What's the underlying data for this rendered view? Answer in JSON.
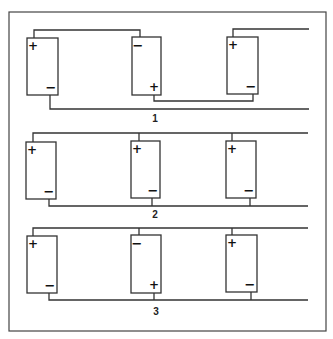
{
  "figure": {
    "colors": {
      "line": "#333333",
      "background": "#ffffff",
      "frame": "#444444"
    },
    "frame": {
      "x": 9,
      "y": 12,
      "w": 317,
      "h": 319
    },
    "diagrams": [
      {
        "label": "1",
        "label_pos": [
          155,
          122
        ],
        "type": "series",
        "batteries": [
          {
            "x": 27,
            "y": 38,
            "w": 31,
            "h": 57,
            "top_sign": "+",
            "bottom_sign": "−",
            "top_tap": 34,
            "bottom_tap": 50
          },
          {
            "x": 132,
            "y": 37,
            "w": 29,
            "h": 58,
            "top_sign": "−",
            "bottom_sign": "+",
            "top_tap": 140,
            "bottom_tap": 154
          },
          {
            "x": 227,
            "y": 37,
            "w": 31,
            "h": 57,
            "top_sign": "+",
            "bottom_sign": "−",
            "top_tap": 233,
            "bottom_tap": 253
          }
        ],
        "wires": [
          {
            "points": [
              [
                34,
                38
              ],
              [
                34,
                30
              ],
              [
                140,
                30
              ],
              [
                140,
                37
              ]
            ]
          },
          {
            "points": [
              [
                154,
                95
              ],
              [
                154,
                101
              ],
              [
                253,
                101
              ],
              [
                253,
                94
              ]
            ]
          },
          {
            "points": [
              [
                233,
                37
              ],
              [
                233,
                29
              ],
              [
                309,
                29
              ]
            ]
          },
          {
            "points": [
              [
                50,
                95
              ],
              [
                50,
                109
              ],
              [
                309,
                109
              ]
            ]
          }
        ]
      },
      {
        "label": "2",
        "label_pos": [
          155,
          218
        ],
        "type": "parallel",
        "batteries": [
          {
            "x": 26,
            "y": 142,
            "w": 30,
            "h": 57,
            "top_sign": "+",
            "bottom_sign": "−",
            "top_tap": 33,
            "bottom_tap": 49
          },
          {
            "x": 131,
            "y": 141,
            "w": 29,
            "h": 57,
            "top_sign": "+",
            "bottom_sign": "−",
            "top_tap": 139,
            "bottom_tap": 152
          },
          {
            "x": 226,
            "y": 141,
            "w": 30,
            "h": 57,
            "top_sign": "+",
            "bottom_sign": "−",
            "top_tap": 232,
            "bottom_tap": 250
          }
        ],
        "wires": [
          {
            "points": [
              [
                33,
                142
              ],
              [
                33,
                133
              ],
              [
                308,
                133
              ]
            ]
          },
          {
            "points": [
              [
                139,
                133
              ],
              [
                139,
                141
              ]
            ]
          },
          {
            "points": [
              [
                232,
                133
              ],
              [
                232,
                141
              ]
            ]
          },
          {
            "points": [
              [
                49,
                199
              ],
              [
                49,
                206
              ],
              [
                308,
                206
              ]
            ]
          },
          {
            "points": [
              [
                152,
                198
              ],
              [
                152,
                206
              ]
            ]
          },
          {
            "points": [
              [
                250,
                198
              ],
              [
                250,
                206
              ]
            ]
          }
        ]
      },
      {
        "label": "3",
        "label_pos": [
          156,
          315
        ],
        "type": "parallel-mixed",
        "batteries": [
          {
            "x": 27,
            "y": 236,
            "w": 30,
            "h": 57,
            "top_sign": "+",
            "bottom_sign": "−",
            "top_tap": 33,
            "bottom_tap": 49
          },
          {
            "x": 131,
            "y": 235,
            "w": 30,
            "h": 58,
            "top_sign": "−",
            "bottom_sign": "+",
            "top_tap": 139,
            "bottom_tap": 154
          },
          {
            "x": 226,
            "y": 235,
            "w": 31,
            "h": 57,
            "top_sign": "+",
            "bottom_sign": "−",
            "top_tap": 232,
            "bottom_tap": 251
          }
        ],
        "wires": [
          {
            "points": [
              [
                33,
                236
              ],
              [
                33,
                228
              ],
              [
                308,
                228
              ]
            ]
          },
          {
            "points": [
              [
                139,
                228
              ],
              [
                139,
                235
              ]
            ]
          },
          {
            "points": [
              [
                232,
                228
              ],
              [
                232,
                235
              ]
            ]
          },
          {
            "points": [
              [
                49,
                293
              ],
              [
                49,
                300
              ],
              [
                308,
                300
              ]
            ]
          },
          {
            "points": [
              [
                154,
                293
              ],
              [
                154,
                300
              ]
            ]
          },
          {
            "points": [
              [
                251,
                292
              ],
              [
                251,
                300
              ]
            ]
          }
        ]
      }
    ]
  }
}
